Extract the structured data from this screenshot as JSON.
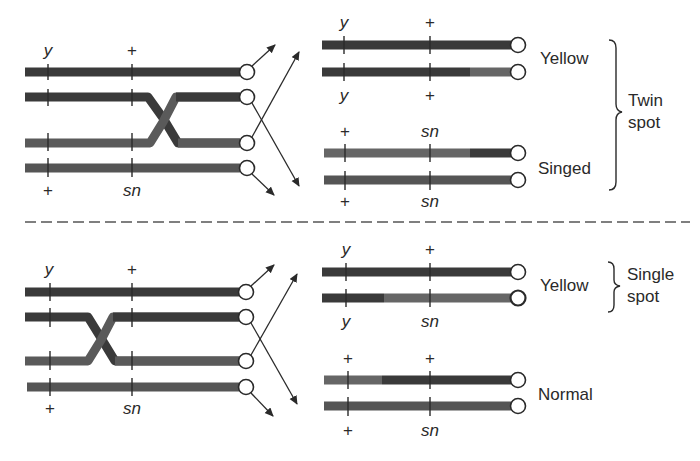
{
  "colors": {
    "dark_chromosome": "#3a3a3a",
    "light_chromosome": "#6a6a6a",
    "line": "#2a2a2a",
    "background": "#ffffff"
  },
  "panels": [
    {
      "id": "top",
      "left_loci_top": [
        "y",
        "+"
      ],
      "left_loci_bottom": [
        "+",
        "sn"
      ],
      "right_groups": [
        {
          "loci_top": [
            "y",
            "+"
          ],
          "loci_bottom": [
            "y",
            "+"
          ],
          "phenotype": "Yellow"
        },
        {
          "loci_top": [
            "+",
            "sn"
          ],
          "loci_bottom": [
            "+",
            "sn"
          ],
          "phenotype": "Singed"
        }
      ],
      "bracket_label_line1": "Twin",
      "bracket_label_line2": "spot"
    },
    {
      "id": "bottom",
      "left_loci_top": [
        "y",
        "+"
      ],
      "left_loci_bottom": [
        "+",
        "sn"
      ],
      "right_groups": [
        {
          "loci_top": [
            "y",
            "+"
          ],
          "loci_bottom": [
            "y",
            "sn"
          ],
          "phenotype": "Yellow"
        },
        {
          "loci_top": [
            "+",
            "+"
          ],
          "loci_bottom": [
            "+",
            "sn"
          ],
          "phenotype": "Normal"
        }
      ],
      "bracket_label_line1": "Single",
      "bracket_label_line2": "spot"
    }
  ]
}
